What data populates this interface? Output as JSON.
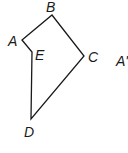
{
  "figure": {
    "type": "polygon",
    "vertices": [
      {
        "name": "A",
        "x": 22,
        "y": 40,
        "label_x": 8,
        "label_y": 46
      },
      {
        "name": "B",
        "x": 52,
        "y": 15,
        "label_x": 46,
        "label_y": 12
      },
      {
        "name": "C",
        "x": 84,
        "y": 56,
        "label_x": 88,
        "label_y": 62
      },
      {
        "name": "D",
        "x": 31,
        "y": 119,
        "label_x": 24,
        "label_y": 137
      },
      {
        "name": "E",
        "x": 32,
        "y": 52,
        "label_x": 35,
        "label_y": 60
      }
    ],
    "edges": [
      "A-B",
      "B-C",
      "C-D",
      "D-E",
      "E-A"
    ],
    "extra_label": {
      "text": "A'",
      "x": 116,
      "y": 66
    },
    "stroke_color": "#1a1a1a"
  }
}
